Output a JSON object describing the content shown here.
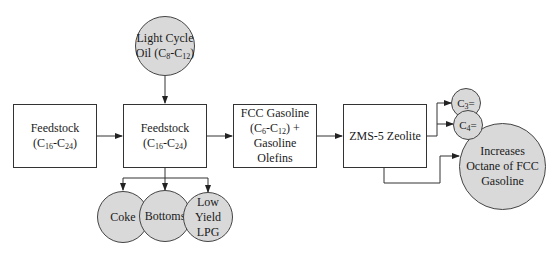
{
  "diagram": {
    "type": "process-flow",
    "colors": {
      "circle_fill": "#d9d9d9",
      "stroke": "#333333",
      "box_fill": "#ffffff"
    },
    "nodes": {
      "feedstock_1": {
        "shape": "box",
        "line1": "Feedstock",
        "line2_prefix": "(C",
        "line2_sub1": "16",
        "line2_mid": "-C",
        "line2_sub2": "24",
        "line2_suffix": ")"
      },
      "feedstock_2": {
        "shape": "box",
        "line1": "Feedstock",
        "line2_prefix": "(C",
        "line2_sub1": "16",
        "line2_mid": "-C",
        "line2_sub2": "24",
        "line2_suffix": ")"
      },
      "light_cycle_oil": {
        "shape": "circle",
        "line1": "Light Cycle",
        "line2_prefix": "Oil (C",
        "line2_sub1": "8",
        "line2_mid": "-C",
        "line2_sub2": "12",
        "line2_suffix": ")"
      },
      "fcc_gasoline": {
        "shape": "box",
        "line1": "FCC Gasoline",
        "line2_prefix": "(C",
        "line2_sub1": "6",
        "line2_mid": "-C",
        "line2_sub2": "12",
        "line2_suffix": ") +",
        "line3": "Gasoline",
        "line4": "Olefins"
      },
      "zms5": {
        "shape": "box",
        "line1": "ZMS-5 Zeolite"
      },
      "coke": {
        "shape": "circle",
        "line1": "Coke"
      },
      "bottoms": {
        "shape": "circle",
        "line1": "Bottoms"
      },
      "lpg": {
        "shape": "circle",
        "line1": "Low",
        "line2": "Yield",
        "line3": "LPG"
      },
      "c3": {
        "shape": "circle",
        "prefix": "C",
        "sub": "3",
        "suffix": "="
      },
      "c4": {
        "shape": "circle",
        "prefix": "C",
        "sub": "4",
        "suffix": "="
      },
      "octane": {
        "shape": "circle",
        "line1": "Increases",
        "line2": "Octane of FCC",
        "line3": "Gasoline"
      }
    },
    "edges": [
      {
        "from": "feedstock_1",
        "to": "feedstock_2"
      },
      {
        "from": "light_cycle_oil",
        "to": "feedstock_2"
      },
      {
        "from": "feedstock_2",
        "to": "fcc_gasoline"
      },
      {
        "from": "feedstock_2",
        "to": "coke"
      },
      {
        "from": "feedstock_2",
        "to": "bottoms"
      },
      {
        "from": "feedstock_2",
        "to": "lpg"
      },
      {
        "from": "fcc_gasoline",
        "to": "zms5"
      },
      {
        "from": "zms5",
        "to": "c3"
      },
      {
        "from": "zms5",
        "to": "c4"
      },
      {
        "from": "zms5",
        "to": "octane"
      }
    ]
  }
}
